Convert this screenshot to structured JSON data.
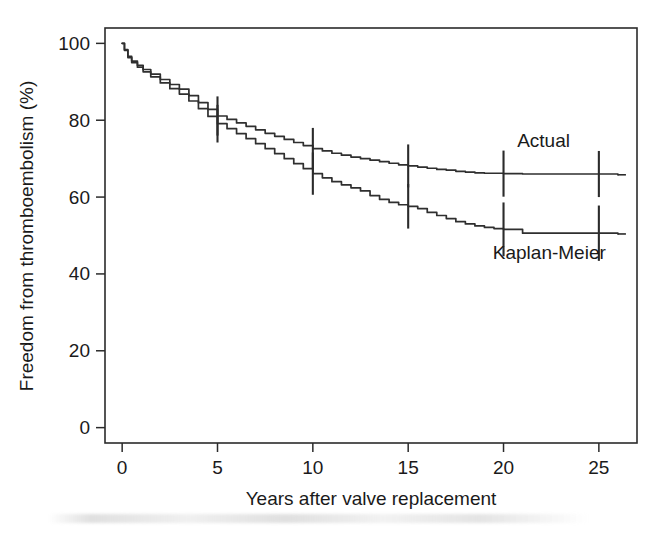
{
  "figure": {
    "width": 662,
    "height": 535,
    "background": "#ffffff",
    "ink_color": "#2b2b2b"
  },
  "chart_data": {
    "type": "line",
    "title": "",
    "subtitle": "",
    "xlabel": "Years after valve replacement",
    "ylabel": "Freedom from thromboembolism (%)",
    "xlim": [
      -0.9,
      27.0
    ],
    "ylim": [
      -4,
      104
    ],
    "xticks": [
      0,
      5,
      10,
      15,
      20,
      25
    ],
    "xtick_labels": [
      "0",
      "5",
      "10",
      "15",
      "20",
      "25"
    ],
    "yticks": [
      0,
      20,
      40,
      60,
      80,
      100
    ],
    "ytick_labels": [
      "0",
      "20",
      "40",
      "60",
      "80",
      "100"
    ],
    "grid": false,
    "legend_position": "inline-annotation",
    "annotations": [
      {
        "text": "Actual",
        "x": 22.1,
        "y": 73.0
      },
      {
        "text": "Kaplan-Meier",
        "x": 22.4,
        "y": 44.0
      }
    ],
    "series": [
      {
        "name": "Actual",
        "label": "Actual",
        "color": "#2f2f2f",
        "x": [
          0.0,
          0.12,
          0.3,
          0.5,
          0.8,
          1.1,
          1.5,
          2.0,
          2.5,
          3.0,
          3.5,
          4.0,
          4.5,
          5.0,
          5.5,
          6.0,
          6.5,
          7.0,
          7.5,
          8.0,
          8.5,
          9.0,
          9.5,
          10.0,
          10.5,
          11.0,
          11.5,
          12.0,
          12.5,
          13.0,
          13.5,
          14.0,
          14.5,
          15.0,
          15.5,
          16.0,
          16.5,
          17.0,
          17.5,
          18.0,
          18.5,
          19.0,
          20.0,
          21.0,
          22.0,
          23.0,
          24.0,
          25.0,
          26.0
        ],
        "y": [
          100.0,
          98.4,
          96.6,
          95.4,
          94.3,
          93.2,
          92.0,
          90.6,
          89.3,
          88.1,
          86.4,
          84.6,
          82.8,
          81.1,
          80.2,
          79.3,
          78.4,
          77.5,
          76.6,
          75.8,
          75.0,
          74.2,
          73.4,
          72.6,
          72.0,
          71.4,
          70.9,
          70.4,
          70.0,
          69.6,
          69.2,
          68.8,
          68.4,
          68.1,
          67.8,
          67.5,
          67.2,
          67.0,
          66.7,
          66.5,
          66.3,
          66.2,
          66.1,
          66.0,
          66.0,
          66.0,
          66.0,
          66.0,
          65.8
        ],
        "ci_marks": [
          {
            "x": 5.0,
            "y": 81.1,
            "low": 76.0,
            "high": 86.2
          },
          {
            "x": 10.0,
            "y": 72.6,
            "low": 67.2,
            "high": 78.0
          },
          {
            "x": 15.0,
            "y": 68.1,
            "low": 62.5,
            "high": 73.7
          },
          {
            "x": 20.0,
            "y": 66.1,
            "low": 60.1,
            "high": 72.1
          },
          {
            "x": 25.0,
            "y": 66.0,
            "low": 60.0,
            "high": 72.0
          }
        ]
      },
      {
        "name": "Kaplan-Meier",
        "label": "Kaplan-Meier",
        "color": "#2f2f2f",
        "x": [
          0.0,
          0.12,
          0.3,
          0.5,
          0.8,
          1.1,
          1.5,
          2.0,
          2.5,
          3.0,
          3.5,
          4.0,
          4.5,
          5.0,
          5.5,
          6.0,
          6.5,
          7.0,
          7.5,
          8.0,
          8.5,
          9.0,
          9.5,
          10.0,
          10.5,
          11.0,
          11.5,
          12.0,
          12.5,
          13.0,
          13.5,
          14.0,
          14.5,
          15.0,
          15.5,
          16.0,
          16.5,
          17.0,
          17.5,
          18.0,
          18.5,
          19.0,
          19.5,
          20.0,
          20.9,
          21.0,
          22.0,
          23.0,
          24.0,
          25.0,
          26.0
        ],
        "y": [
          100.0,
          98.2,
          96.3,
          95.0,
          93.8,
          92.6,
          91.3,
          89.7,
          88.2,
          86.8,
          85.0,
          83.0,
          81.0,
          79.1,
          77.8,
          76.5,
          75.2,
          73.9,
          72.6,
          71.3,
          70.0,
          68.7,
          67.4,
          66.1,
          65.0,
          64.0,
          63.2,
          62.4,
          61.6,
          60.4,
          59.4,
          58.6,
          58.0,
          57.6,
          57.0,
          56.0,
          55.2,
          54.4,
          53.6,
          53.0,
          52.5,
          52.1,
          51.8,
          51.6,
          51.6,
          50.6,
          50.6,
          50.6,
          50.6,
          50.6,
          50.4
        ],
        "ci_marks": [
          {
            "x": 5.0,
            "y": 79.1,
            "low": 74.2,
            "high": 84.0
          },
          {
            "x": 10.0,
            "y": 66.1,
            "low": 60.6,
            "high": 71.6
          },
          {
            "x": 15.0,
            "y": 57.6,
            "low": 51.8,
            "high": 63.4
          },
          {
            "x": 20.0,
            "y": 51.6,
            "low": 44.6,
            "high": 58.6
          },
          {
            "x": 25.0,
            "y": 50.6,
            "low": 43.4,
            "high": 57.8
          }
        ]
      }
    ]
  }
}
